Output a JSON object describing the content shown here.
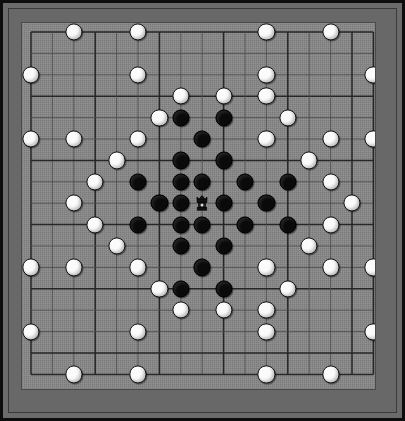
{
  "app": {
    "title": "Hnefatafl Board",
    "board_name": "tafl-board"
  },
  "board": {
    "size_lines": 17,
    "cell_px": 21.4,
    "origin_x": 9,
    "origin_y": 9,
    "colors": {
      "outer_border": "#0d0d0d",
      "frame": "#686868",
      "surface": "#8a8a8a",
      "grid_line": "#262626",
      "grid_line_minor": "#4e4e4e",
      "stone_white": "#fbfbfb",
      "stone_black": "#0a0a0a",
      "stone_outline": "#111111"
    },
    "grid": {
      "major_every": 3,
      "show_minor": true
    },
    "stone_radius": 8.6,
    "king_label": "king"
  },
  "pieces": {
    "white_label": "attacker",
    "black_label": "defender",
    "king_label": "king",
    "white": [
      [
        2,
        0
      ],
      [
        5,
        0
      ],
      [
        11,
        0
      ],
      [
        14,
        0
      ],
      [
        0,
        2
      ],
      [
        5,
        2
      ],
      [
        11,
        2
      ],
      [
        16,
        2
      ],
      [
        7,
        3
      ],
      [
        9,
        3
      ],
      [
        11,
        3
      ],
      [
        6,
        4
      ],
      [
        12,
        4
      ],
      [
        0,
        5
      ],
      [
        2,
        5
      ],
      [
        5,
        5
      ],
      [
        11,
        5
      ],
      [
        14,
        5
      ],
      [
        16,
        5
      ],
      [
        4,
        6
      ],
      [
        13,
        6
      ],
      [
        3,
        7
      ],
      [
        14,
        7
      ],
      [
        2,
        8
      ],
      [
        15,
        8
      ],
      [
        3,
        9
      ],
      [
        14,
        9
      ],
      [
        4,
        10
      ],
      [
        13,
        10
      ],
      [
        0,
        11
      ],
      [
        2,
        11
      ],
      [
        5,
        11
      ],
      [
        11,
        11
      ],
      [
        14,
        11
      ],
      [
        16,
        11
      ],
      [
        6,
        12
      ],
      [
        12,
        12
      ],
      [
        7,
        13
      ],
      [
        9,
        13
      ],
      [
        11,
        13
      ],
      [
        0,
        14
      ],
      [
        5,
        14
      ],
      [
        11,
        14
      ],
      [
        16,
        14
      ],
      [
        2,
        16
      ],
      [
        5,
        16
      ],
      [
        11,
        16
      ],
      [
        14,
        16
      ]
    ],
    "black": [
      [
        7,
        4
      ],
      [
        9,
        4
      ],
      [
        8,
        5
      ],
      [
        7,
        6
      ],
      [
        9,
        6
      ],
      [
        5,
        7
      ],
      [
        7,
        7
      ],
      [
        8,
        7
      ],
      [
        10,
        7
      ],
      [
        12,
        7
      ],
      [
        6,
        8
      ],
      [
        7,
        8
      ],
      [
        9,
        8
      ],
      [
        11,
        8
      ],
      [
        5,
        9
      ],
      [
        7,
        9
      ],
      [
        8,
        9
      ],
      [
        10,
        9
      ],
      [
        12,
        9
      ],
      [
        7,
        10
      ],
      [
        9,
        10
      ],
      [
        8,
        11
      ],
      [
        7,
        12
      ],
      [
        9,
        12
      ]
    ],
    "king": [
      8,
      8
    ]
  },
  "status": {
    "center_cell_label": "throne",
    "turn": ""
  }
}
